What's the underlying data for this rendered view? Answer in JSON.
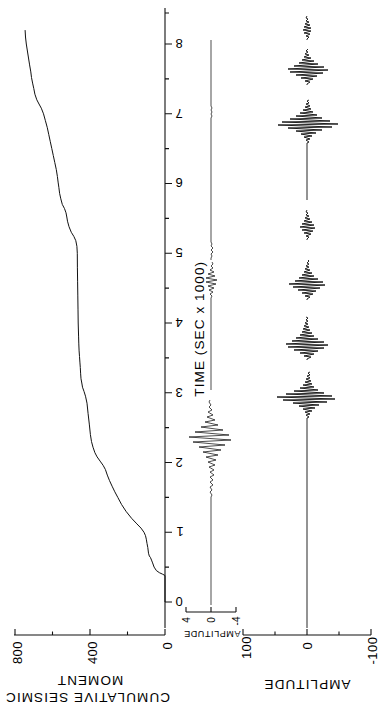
{
  "figure": {
    "orientation": "rotated-90",
    "background": "#ffffff",
    "ink_color": "#111111"
  },
  "panels": {
    "moment": {
      "axis_title_line1": "CUMULATIVE SEISMIC",
      "axis_title_line2": "MOMENT",
      "tick_labels": [
        "0",
        "400",
        "800"
      ],
      "tick_values": [
        0,
        400,
        800
      ]
    },
    "seismogram_main": {
      "axis_title": "AMPLITUDE",
      "tick_labels": [
        "100",
        "0",
        "-100"
      ],
      "tick_values": [
        100,
        0,
        -100
      ]
    },
    "seismogram_inset": {
      "axis_title": "AMPLITUDE",
      "tick_labels": [
        "4",
        "0",
        "-4"
      ],
      "tick_values": [
        4,
        0,
        -4
      ]
    },
    "time": {
      "axis_title": "TIME (SEC x 1000)",
      "tick_labels": [
        "0",
        "1",
        "2",
        "3",
        "4",
        "5",
        "6",
        "7",
        "8"
      ],
      "tick_values": [
        0,
        1,
        2,
        3,
        4,
        5,
        6,
        7,
        8
      ],
      "minor_tick_step": 0.5
    }
  },
  "chart_data": {
    "type": "line",
    "title": "",
    "subtitle": "",
    "xlabel": "TIME (SEC x 1000)",
    "ylabel": "CUMULATIVE SEISMIC MOMENT",
    "xlim": [
      0,
      8.3
    ],
    "ylim": [
      0,
      900
    ],
    "grid": false,
    "legend": null,
    "series": [
      {
        "name": "Cumulative seismic moment",
        "panel": "moment",
        "xlabel": "TIME (SEC x 1000)",
        "ylabel": "CUMULATIVE SEISMIC MOMENT",
        "ytick_labels": [
          "0",
          "400",
          "800"
        ],
        "ytick_values": [
          0,
          400,
          800
        ],
        "x": [
          0.0,
          0.38,
          0.4,
          0.42,
          0.45,
          0.5,
          0.56,
          0.6,
          0.64,
          0.66,
          0.7,
          0.78,
          0.84,
          0.9,
          0.95,
          1.0,
          1.06,
          1.12,
          1.2,
          1.3,
          1.4,
          1.5,
          1.58,
          1.66,
          1.74,
          1.82,
          1.9,
          1.96,
          2.02,
          2.08,
          2.14,
          2.22,
          2.3,
          2.4,
          2.55,
          2.7,
          2.85,
          2.95,
          3.02,
          3.08,
          3.14,
          3.2,
          3.28,
          3.36,
          3.44,
          3.52,
          3.6,
          3.7,
          3.8,
          3.9,
          4.0,
          4.2,
          4.4,
          4.6,
          4.8,
          5.0,
          5.1,
          5.18,
          5.24,
          5.3,
          5.38,
          5.46,
          5.52,
          5.58,
          5.64,
          5.7,
          5.78,
          5.86,
          5.94,
          6.02,
          6.1,
          6.2,
          6.3,
          6.4,
          6.5,
          6.6,
          6.7,
          6.8,
          6.9,
          7.0,
          7.08,
          7.14,
          7.2,
          7.28,
          7.36,
          7.44,
          7.52,
          7.6,
          7.7,
          7.8,
          7.9,
          8.0,
          8.1,
          8.2
        ],
        "y": [
          0,
          0,
          14,
          30,
          46,
          58,
          66,
          72,
          78,
          84,
          88,
          92,
          96,
          100,
          104,
          112,
          128,
          150,
          178,
          208,
          232,
          252,
          268,
          282,
          296,
          308,
          318,
          330,
          346,
          362,
          374,
          384,
          392,
          398,
          404,
          410,
          416,
          424,
          432,
          440,
          444,
          448,
          450,
          452,
          454,
          456,
          458,
          460,
          461,
          462,
          463,
          464,
          465,
          466,
          467,
          468,
          470,
          476,
          486,
          500,
          512,
          520,
          524,
          528,
          536,
          548,
          556,
          562,
          566,
          570,
          574,
          580,
          588,
          596,
          604,
          612,
          620,
          628,
          638,
          648,
          660,
          672,
          684,
          694,
          700,
          706,
          712,
          716,
          722,
          728,
          734,
          740,
          744,
          746
        ]
      },
      {
        "name": "Seismogram amplitude (main trace)",
        "panel": "seismogram_main",
        "ylabel": "AMPLITUDE",
        "ytick_labels": [
          "100",
          "0",
          "-100"
        ],
        "ytick_values": [
          100,
          0,
          -100
        ],
        "ylim": [
          -100,
          100
        ],
        "description": "Near-zero baseline from t=0 to ~2.6, then a large high-frequency wavetrain from ~2.6 to ~5.4 with peak amplitudes near +/-100, quiescence ~5.6 to ~6.9, then a second large burst from ~6.9 to ~8.2.",
        "bursts": [
          {
            "t_start": 2.6,
            "t_end": 2.72,
            "peak": 95
          },
          {
            "t_start": 2.72,
            "t_end": 3.1,
            "peak": 60
          },
          {
            "t_start": 3.1,
            "t_end": 3.55,
            "peak": 75
          },
          {
            "t_start": 3.55,
            "t_end": 4.2,
            "peak": 45
          },
          {
            "t_start": 4.2,
            "t_end": 4.6,
            "peak": 35
          },
          {
            "t_start": 4.6,
            "t_end": 5.0,
            "peak": 70
          },
          {
            "t_start": 5.0,
            "t_end": 5.4,
            "peak": 30
          },
          {
            "t_start": 6.9,
            "t_end": 7.5,
            "peak": 85
          },
          {
            "t_start": 7.5,
            "t_end": 7.95,
            "peak": 55
          },
          {
            "t_start": 7.95,
            "t_end": 8.2,
            "peak": 25
          }
        ]
      },
      {
        "name": "Seismogram amplitude (inset trace)",
        "panel": "seismogram_inset",
        "ylabel": "AMPLITUDE",
        "ytick_labels": [
          "4",
          "0",
          "-4"
        ],
        "ytick_values": [
          4,
          0,
          -4
        ],
        "ylim": [
          -4,
          4
        ],
        "description": "Flat baseline with a single compact wavelet centred near t = 2.0 reaching about +/-3.5, and low-level noise elsewhere.",
        "bursts": [
          {
            "t_start": 1.8,
            "t_end": 2.25,
            "peak": 3.5
          },
          {
            "t_start": 2.6,
            "t_end": 3.2,
            "peak": 1.0
          }
        ]
      }
    ]
  }
}
